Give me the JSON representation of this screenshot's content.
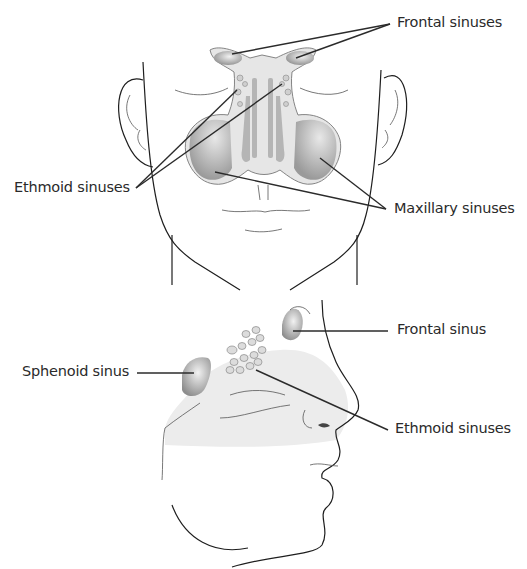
{
  "diagram": {
    "front_view": {
      "labels": {
        "frontal": "Frontal sinuses",
        "ethmoid": "Ethmoid sinuses",
        "maxillary": "Maxillary sinuses"
      }
    },
    "side_view": {
      "labels": {
        "frontal": "Frontal sinus",
        "sphenoid": "Sphenoid sinus",
        "ethmoid": "Ethmoid sinuses"
      }
    },
    "colors": {
      "line": "#2b2b2b",
      "sinus_fill": "#a8a8a8",
      "sinus_light": "#e4e4e4",
      "shade": "#ececec"
    }
  }
}
